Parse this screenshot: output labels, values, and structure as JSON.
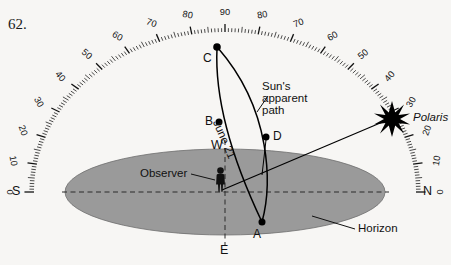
{
  "figure": {
    "number": "62.",
    "type": "celestial-sphere-diagram"
  },
  "labels": {
    "point_a": "A",
    "point_b": "B",
    "point_c": "C",
    "point_d": "D",
    "observer": "Observer",
    "horizon": "Horizon",
    "polaris": "Polaris",
    "sun_path_line1": "Sun's",
    "sun_path_line2": "apparent",
    "sun_path_line3": "path",
    "date": "June 21"
  },
  "cardinals": {
    "south": "S",
    "north": "N",
    "west": "W",
    "east": "E"
  },
  "scale": {
    "unit": "degrees",
    "min": 0,
    "max": 90,
    "major_step": 10,
    "left_ticks": [
      "0",
      "10",
      "20",
      "30",
      "40",
      "50",
      "60",
      "70",
      "80",
      "90"
    ],
    "right_ticks": [
      "90",
      "80",
      "70",
      "60",
      "50",
      "40",
      "30",
      "20",
      "10",
      "0"
    ]
  },
  "colors": {
    "horizon_fill": "#9a9a9a",
    "line": "#000000",
    "background": "#f7f6f4",
    "star": "#000000"
  },
  "chart_data": {
    "type": "diagram",
    "elements": [
      {
        "name": "altitude-scale",
        "range": [
          0,
          90
        ],
        "description": "protractor arc graduated in degrees from horizon (0) to zenith (90) on both the south and north sides"
      },
      {
        "name": "horizon-plane",
        "description": "gray ellipse representing the observer's horizon"
      },
      {
        "name": "observer",
        "description": "human figure at center of horizon plane"
      },
      {
        "name": "sun-apparent-path",
        "description": "arc from A through D to C, the sun's daily path"
      },
      {
        "name": "june-21-line",
        "description": "line from C through B down to A labeled June 21"
      },
      {
        "name": "polaris-sightline",
        "description": "straight line from observer to Polaris near 25 degrees above north horizon"
      }
    ],
    "points": [
      {
        "label": "A",
        "location": "on horizon, southeast of observer, base of sun's path"
      },
      {
        "label": "B",
        "location": "on June 21 line, above horizon near zenith"
      },
      {
        "label": "C",
        "location": "zenith, at 90 degrees on the scale"
      },
      {
        "label": "D",
        "location": "on sun's apparent path, right of B"
      }
    ]
  }
}
